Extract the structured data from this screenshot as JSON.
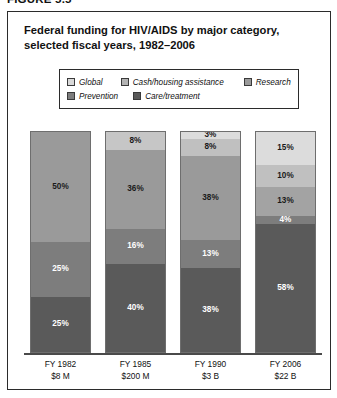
{
  "figure": {
    "label": "FIGURE 5.5"
  },
  "title": "Federal funding for HIV/AIDS by major category, selected fiscal years, 1982–2006",
  "legend": {
    "items": [
      {
        "label": "Global",
        "color": "#d9d9d9"
      },
      {
        "label": "Cash/housing assistance",
        "color": "#b3b3b3"
      },
      {
        "label": "Research",
        "color": "#9a9a9a"
      },
      {
        "label": "Prevention",
        "color": "#7d7d7d"
      },
      {
        "label": "Care/treatment",
        "color": "#5a5a5a"
      }
    ]
  },
  "chart_data": {
    "type": "bar",
    "subtype": "stacked-100-percent",
    "title": "Federal funding for HIV/AIDS by major category, selected fiscal years, 1982–2006",
    "xlabel": "",
    "ylabel": "",
    "ylim": [
      0,
      100
    ],
    "grid": false,
    "legend_position": "top",
    "categories": [
      "FY 1982",
      "FY 1985",
      "FY 1990",
      "FY 2006"
    ],
    "category_sublabels": [
      "$8 M",
      "$200 M",
      "$3 B",
      "$22 B"
    ],
    "series": [
      {
        "name": "Global",
        "color": "#d9d9d9",
        "values": [
          null,
          null,
          3,
          15
        ]
      },
      {
        "name": "Cash/housing assistance",
        "color": "#b3b3b3",
        "values": [
          null,
          8,
          8,
          10
        ]
      },
      {
        "name": "Research",
        "color": "#9a9a9a",
        "values": [
          50,
          36,
          38,
          13
        ]
      },
      {
        "name": "Prevention",
        "color": "#7d7d7d",
        "values": [
          25,
          16,
          13,
          4
        ]
      },
      {
        "name": "Care/treatment",
        "color": "#5a5a5a",
        "values": [
          25,
          40,
          38,
          58
        ]
      }
    ],
    "bars": [
      {
        "category": "FY 1982",
        "sublabel": "$8 M",
        "segments": [
          {
            "series": "Research",
            "value": 50,
            "label": "50%",
            "color": "#9a9a9a",
            "text_color": "#1a1a1a"
          },
          {
            "series": "Prevention",
            "value": 25,
            "label": "25%",
            "color": "#7d7d7d",
            "text_color": "#ffffff"
          },
          {
            "series": "Care/treatment",
            "value": 25,
            "label": "25%",
            "color": "#5a5a5a",
            "text_color": "#ffffff"
          }
        ]
      },
      {
        "category": "FY 1985",
        "sublabel": "$200 M",
        "segments": [
          {
            "series": "Cash/housing assistance",
            "value": 8,
            "label": "8%",
            "color": "#c6c6c6",
            "text_color": "#1a1a1a"
          },
          {
            "series": "Research",
            "value": 36,
            "label": "36%",
            "color": "#9a9a9a",
            "text_color": "#1a1a1a"
          },
          {
            "series": "Prevention",
            "value": 16,
            "label": "16%",
            "color": "#7d7d7d",
            "text_color": "#ffffff"
          },
          {
            "series": "Care/treatment",
            "value": 40,
            "label": "40%",
            "color": "#5a5a5a",
            "text_color": "#ffffff"
          }
        ]
      },
      {
        "category": "FY 1990",
        "sublabel": "$3 B",
        "segments": [
          {
            "series": "Global",
            "value": 3,
            "label": "3%",
            "color": "#dcdcdc",
            "text_color": "#1a1a1a"
          },
          {
            "series": "Cash/housing assistance",
            "value": 8,
            "label": "8%",
            "color": "#c0c0c0",
            "text_color": "#1a1a1a"
          },
          {
            "series": "Research",
            "value": 38,
            "label": "38%",
            "color": "#9a9a9a",
            "text_color": "#1a1a1a"
          },
          {
            "series": "Prevention",
            "value": 13,
            "label": "13%",
            "color": "#7d7d7d",
            "text_color": "#ffffff"
          },
          {
            "series": "Care/treatment",
            "value": 38,
            "label": "38%",
            "color": "#5a5a5a",
            "text_color": "#ffffff"
          }
        ]
      },
      {
        "category": "FY 2006",
        "sublabel": "$22 B",
        "segments": [
          {
            "series": "Global",
            "value": 15,
            "label": "15%",
            "color": "#dcdcdc",
            "text_color": "#1a1a1a"
          },
          {
            "series": "Cash/housing assistance",
            "value": 10,
            "label": "10%",
            "color": "#c0c0c0",
            "text_color": "#1a1a1a"
          },
          {
            "series": "Research",
            "value": 13,
            "label": "13%",
            "color": "#a3a3a3",
            "text_color": "#1a1a1a"
          },
          {
            "series": "Prevention",
            "value": 4,
            "label": "4%",
            "color": "#7d7d7d",
            "text_color": "#ffffff"
          },
          {
            "series": "Care/treatment",
            "value": 58,
            "label": "58%",
            "color": "#5a5a5a",
            "text_color": "#ffffff"
          }
        ]
      }
    ]
  }
}
